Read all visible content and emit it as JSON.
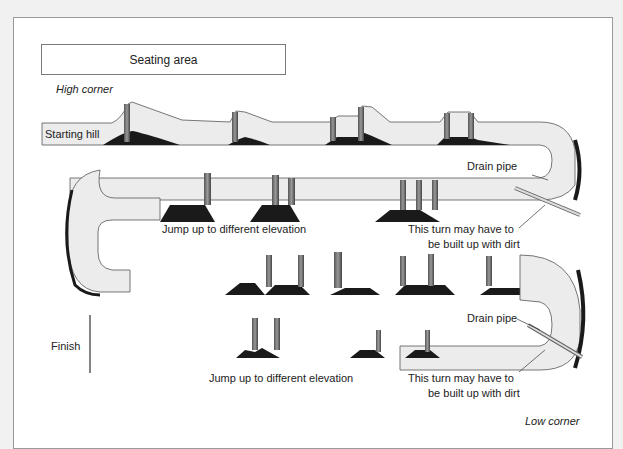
{
  "diagram": {
    "seating_area": "Seating area",
    "high_corner": "High corner",
    "low_corner": "Low corner",
    "starting_hill": "Starting hill",
    "finish": "Finish",
    "labels": {
      "jump_1": "Jump up to different elevation",
      "jump_2": "Jump up to different elevation",
      "drain_pipe_1": "Drain pipe",
      "drain_pipe_2": "Drain pipe",
      "turn_dirt_1_line1": "This turn may have to",
      "turn_dirt_1_line2": "be built up with dirt",
      "turn_dirt_2_line1": "This turn may have to",
      "turn_dirt_2_line2": "be built up with dirt"
    },
    "colors": {
      "track_surface": "#ececec",
      "track_shadow": "#1a1a1a",
      "outline": "#555555"
    }
  }
}
